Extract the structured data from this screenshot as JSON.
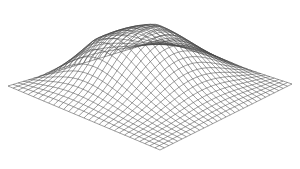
{
  "chart_data": {
    "type": "surface-wireframe",
    "title": "",
    "xlabel": "",
    "ylabel": "",
    "zlabel": "",
    "grid_resolution": [
      30,
      30
    ],
    "surface": "single smooth mound (hill), peak near back-center, ridge running toward the back-left, gentle falloff to front and right edges",
    "view": {
      "projection": "isometric-like",
      "corners_px": {
        "left": [
          8,
          86
        ],
        "back": [
          160,
          40
        ],
        "right": [
          292,
          84
        ],
        "front": [
          160,
          150
        ]
      },
      "max_height_px": 52
    },
    "peaks": [
      {
        "u": 0.38,
        "v": 0.42,
        "height": 1.0,
        "spread": 0.3
      },
      {
        "u": 0.22,
        "v": 0.62,
        "height": 0.45,
        "spread": 0.18
      }
    ],
    "line_color": "#4a4a4a",
    "background": "#ffffff",
    "axes": "none",
    "legend": "none"
  }
}
